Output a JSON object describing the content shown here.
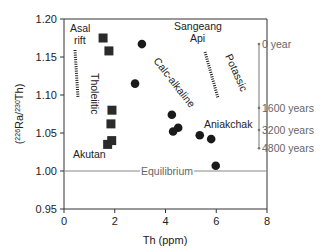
{
  "chart_data": {
    "type": "scatter",
    "title": "",
    "xlabel": "Th (ppm)",
    "ylabel": "(226Ra/230Th)",
    "ylabel_parts": {
      "open": "(",
      "sup1": "226",
      "mid": "Ra/",
      "sup2": "230",
      "close": "Th)"
    },
    "xlim": [
      0,
      8
    ],
    "ylim": [
      0.95,
      1.2
    ],
    "x_ticks": [
      "0",
      "2",
      "4",
      "6",
      "8"
    ],
    "y_ticks": [
      "0.95",
      "1.00",
      "1.05",
      "1.10",
      "1.15",
      "1.20"
    ],
    "grid": false,
    "series": [
      {
        "name": "Tholeiitic",
        "marker": "square",
        "points": [
          {
            "x": 1.54,
            "y": 1.175
          },
          {
            "x": 1.77,
            "y": 1.158
          },
          {
            "x": 1.89,
            "y": 1.08
          },
          {
            "x": 1.85,
            "y": 1.062
          },
          {
            "x": 1.72,
            "y": 1.035
          },
          {
            "x": 1.88,
            "y": 1.04
          }
        ]
      },
      {
        "name": "Calc-alkaline",
        "marker": "circle",
        "points": [
          {
            "x": 3.07,
            "y": 1.167
          },
          {
            "x": 2.8,
            "y": 1.115
          },
          {
            "x": 4.25,
            "y": 1.074
          },
          {
            "x": 4.5,
            "y": 1.057
          },
          {
            "x": 4.3,
            "y": 1.052
          },
          {
            "x": 5.35,
            "y": 1.047
          },
          {
            "x": 5.8,
            "y": 1.042
          },
          {
            "x": 5.98,
            "y": 1.007
          }
        ]
      }
    ],
    "reference_line": {
      "y": 1.0,
      "label": "Equilibrium"
    },
    "annotations": {
      "asal_rift": [
        "Asal",
        "rift"
      ],
      "tholeiitic": "Tholeiitic",
      "calc_alkaline": "Calc-alkaline",
      "sangeang_api": [
        "Sangeang",
        "Api"
      ],
      "potassic": "Potassic",
      "aniakchak": "Aniakchak",
      "akutan": "Akutan"
    },
    "time_scale": [
      {
        "label": "0 year",
        "y": 1.167
      },
      {
        "label": "1600 years",
        "y": 1.083
      },
      {
        "label": "3200 years",
        "y": 1.054
      },
      {
        "label": "4800 years",
        "y": 1.03
      }
    ]
  }
}
